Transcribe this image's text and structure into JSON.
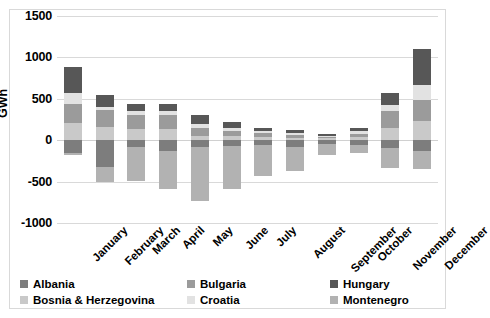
{
  "chart_data": {
    "type": "bar",
    "stacked": true,
    "title": "",
    "xlabel": "",
    "ylabel": "GWh",
    "ylim": [
      -1000,
      1500
    ],
    "yticks": [
      1500,
      1000,
      500,
      0,
      -500,
      -1000
    ],
    "ytick_labels": [
      "1500",
      "1000",
      "500",
      "0",
      "-500",
      "-1000"
    ],
    "grid": true,
    "legend_position": "bottom",
    "categories": [
      "January",
      "February",
      "March",
      "April",
      "May",
      "June",
      "July",
      "August",
      "September",
      "October",
      "November",
      "December"
    ],
    "series": [
      {
        "name": "Albania",
        "color": "#7d7d7d",
        "values": [
          -150,
          -320,
          -80,
          -130,
          -80,
          -70,
          -60,
          -80,
          -45,
          -60,
          -100,
          -130
        ]
      },
      {
        "name": "Bosnia & Herzegovina",
        "color": "#c9c9c9",
        "values": [
          210,
          160,
          130,
          130,
          55,
          45,
          40,
          30,
          25,
          35,
          150,
          230
        ]
      },
      {
        "name": "Bulgaria",
        "color": "#9b9b9b",
        "values": [
          230,
          200,
          170,
          170,
          90,
          70,
          45,
          35,
          20,
          45,
          200,
          260
        ]
      },
      {
        "name": "Croatia",
        "color": "#e2e2e2",
        "values": [
          135,
          45,
          55,
          55,
          50,
          35,
          25,
          20,
          10,
          30,
          80,
          175
        ]
      },
      {
        "name": "Hungary",
        "color": "#575757",
        "values": [
          310,
          135,
          85,
          85,
          105,
          65,
          40,
          35,
          20,
          40,
          140,
          435
        ]
      },
      {
        "name": "Montenegro",
        "color": "#b2b2b2",
        "values": [
          -30,
          -180,
          -410,
          -460,
          -650,
          -515,
          -375,
          -290,
          -130,
          -95,
          -230,
          -215
        ]
      }
    ],
    "notes": {
      "negative_stack_order": [
        "Albania",
        "Montenegro"
      ],
      "positive_stack_order": [
        "Bosnia & Herzegovina",
        "Bulgaria",
        "Croatia",
        "Hungary"
      ]
    }
  },
  "legend": {
    "items": [
      {
        "label": "Albania",
        "color": "#7d7d7d"
      },
      {
        "label": "Bosnia & Herzegovina",
        "color": "#c9c9c9"
      },
      {
        "label": "Bulgaria",
        "color": "#9b9b9b"
      },
      {
        "label": "Croatia",
        "color": "#e2e2e2"
      },
      {
        "label": "Hungary",
        "color": "#575757"
      },
      {
        "label": "Montenegro",
        "color": "#b2b2b2"
      }
    ]
  }
}
